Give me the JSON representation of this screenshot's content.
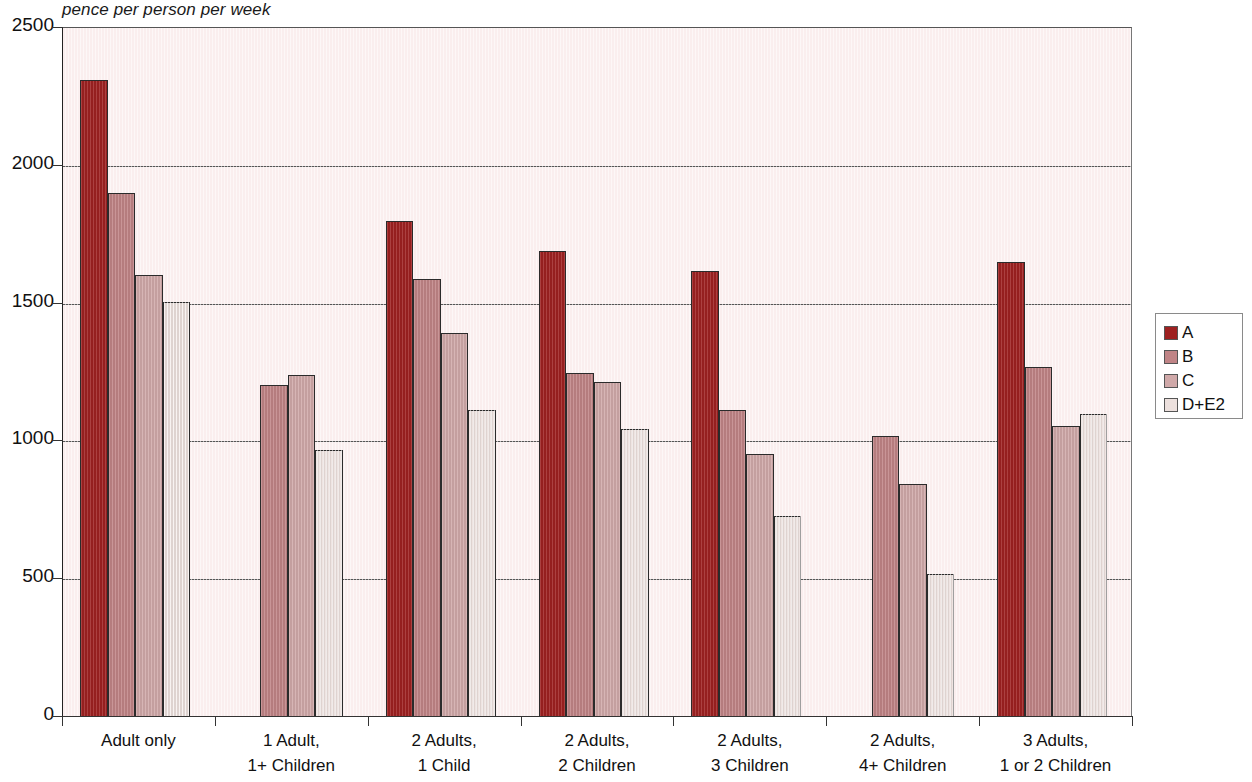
{
  "chart_data": {
    "type": "bar",
    "title": "pence per person per week",
    "subtitle": "",
    "xlabel": "",
    "ylabel": "",
    "ylim": [
      0,
      2500
    ],
    "yticks": [
      0,
      500,
      1000,
      1500,
      2000,
      2500
    ],
    "ytick_labels": [
      "0",
      "500",
      "1000",
      "1500",
      "2000",
      "2500"
    ],
    "grid": true,
    "legend_position": "right",
    "categories": [
      "Adult only",
      "1 Adult,\n1+ Children",
      "2 Adults,\n1 Child",
      "2 Adults,\n2 Children",
      "2 Adults,\n3 Children",
      "2 Adults,\n4+ Children",
      "3 Adults,\n1 or 2 Children"
    ],
    "series": [
      {
        "name": "A",
        "color": "#9e2121",
        "values": [
          2310,
          null,
          1800,
          1690,
          1620,
          null,
          1650
        ]
      },
      {
        "name": "B",
        "color": "#c08486",
        "values": [
          1900,
          1205,
          1590,
          1250,
          1115,
          1020,
          1270
        ]
      },
      {
        "name": "C",
        "color": "#d0a9a9",
        "values": [
          1605,
          1240,
          1395,
          1215,
          955,
          845,
          1055
        ]
      },
      {
        "name": "D+E2",
        "color": "#ece0dd",
        "values": [
          1505,
          970,
          1115,
          1045,
          730,
          520,
          1100
        ]
      }
    ]
  },
  "legend": {
    "entries": [
      {
        "label": "A",
        "color": "#9e2121"
      },
      {
        "label": "B",
        "color": "#c08486"
      },
      {
        "label": "C",
        "color": "#d0a9a9"
      },
      {
        "label": "D+E2",
        "color": "#ece0dd"
      }
    ]
  },
  "colors": {
    "plot_background": "#faeeee",
    "gridline": "#555555",
    "axis": "#222222",
    "bar_outline": "#2b2b2b",
    "text": "#111111"
  }
}
